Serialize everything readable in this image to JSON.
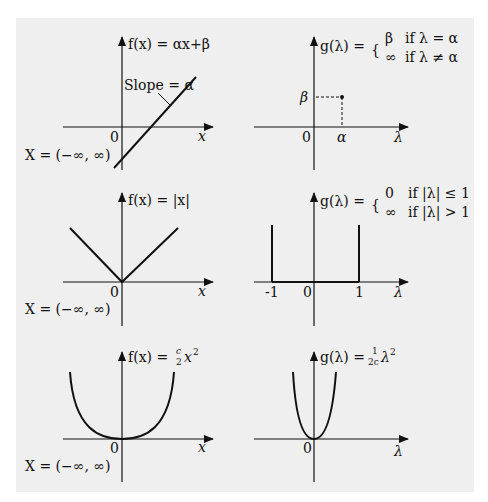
{
  "figure": {
    "panels": [
      {
        "id": "f-linear",
        "title": "f(x) = αx+β",
        "annotation": "Slope = α",
        "origin": "0",
        "x_axis": "x",
        "domain": "X = (−∞, ∞)"
      },
      {
        "id": "g-linear",
        "title_lhs": "g(λ) =",
        "cases": [
          {
            "val": "β",
            "cond": "if λ = α"
          },
          {
            "val": "∞",
            "cond": "if λ ≠ α"
          }
        ],
        "y_tick": "β",
        "x_tick": "α",
        "origin": "0",
        "x_axis": "λ"
      },
      {
        "id": "f-abs",
        "title": "f(x) = |x|",
        "origin": "0",
        "x_axis": "x",
        "domain": "X = (−∞, ∞)"
      },
      {
        "id": "g-abs",
        "title_lhs": "g(λ) =",
        "cases": [
          {
            "val": "0",
            "cond": "if |λ| ≤ 1"
          },
          {
            "val": "∞",
            "cond": "if |λ| > 1"
          }
        ],
        "x_ticks": [
          "-1",
          "0",
          "1"
        ],
        "x_axis": "λ"
      },
      {
        "id": "f-quad",
        "title_lhs": "f(x) =",
        "frac_num": "c",
        "frac_den": "2",
        "title_rhs": "x",
        "sup": "2",
        "origin": "0",
        "x_axis": "x",
        "domain": "X = (−∞, ∞)"
      },
      {
        "id": "g-quad",
        "title_lhs": "g(λ) =",
        "frac_num": "1",
        "frac_den": "2c",
        "title_rhs": "λ",
        "sup": "2",
        "origin": "0",
        "x_axis": "λ"
      }
    ]
  }
}
